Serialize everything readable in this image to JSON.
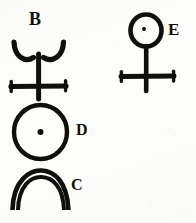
{
  "plate": {
    "kind": "scanned-symbol-plate",
    "background_color": "#fdfdfc",
    "ink_color": "#100f0d",
    "width": 196,
    "height": 223,
    "symbol_count": 4
  },
  "figures": [
    {
      "id": "B",
      "label": "B",
      "label_position": "above",
      "description": "Double-crescent bowl atop a vertical stem crossed by a serifed horizontal bar",
      "parts": [
        "left-crescent",
        "right-crescent",
        "vertical-stem",
        "crossbar",
        "end-serifs"
      ],
      "ink_color": "#100f0d"
    },
    {
      "id": "E",
      "label": "E",
      "label_position": "right",
      "description": "Dotted circle atop a vertical stem crossed by a serifed horizontal bar",
      "parts": [
        "circle",
        "center-dot",
        "vertical-stem",
        "crossbar",
        "end-serifs"
      ],
      "ink_color": "#100f0d"
    },
    {
      "id": "D",
      "label": "D",
      "label_position": "right",
      "description": "Large circle enclosing a single centered dot",
      "parts": [
        "circle",
        "center-dot"
      ],
      "ink_color": "#100f0d"
    },
    {
      "id": "C",
      "label": "C",
      "label_position": "right",
      "description": "Double arc forming an open dome",
      "parts": [
        "outer-arc",
        "inner-arc"
      ],
      "ink_color": "#100f0d"
    }
  ]
}
